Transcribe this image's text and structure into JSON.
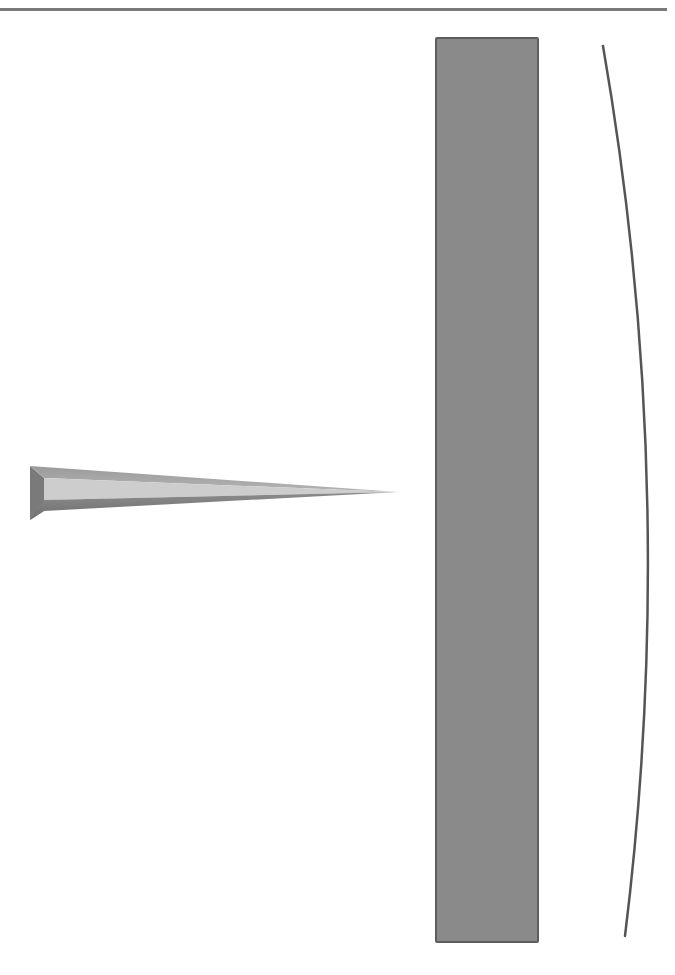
{
  "diagram": {
    "elements": [
      {
        "id": "wedge",
        "description": "tapered triangular wedge pointing right"
      },
      {
        "id": "barrier",
        "description": "tall vertical gray rectangle"
      },
      {
        "id": "curve",
        "description": "thin curved line bowing right"
      }
    ],
    "colors": {
      "rule": "#7a7a7a",
      "barrier_fill": "#8a8a8a",
      "barrier_border": "#5e5e5e",
      "wedge_dark": "#7d7d7d",
      "wedge_light": "#c8c8c8",
      "curve": "#555555"
    }
  }
}
